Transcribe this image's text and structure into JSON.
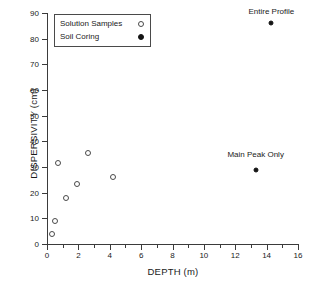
{
  "chart_data": {
    "type": "scatter",
    "title": "",
    "xlabel": "DEPTH (m)",
    "ylabel": "DISPERSIVITY (cm)",
    "xlim": [
      0,
      16
    ],
    "ylim": [
      0,
      90
    ],
    "xticks": [
      0,
      2,
      4,
      6,
      8,
      10,
      12,
      14,
      16
    ],
    "xticks_minor": [
      1,
      3,
      5,
      7,
      9,
      11,
      13,
      15
    ],
    "yticks": [
      0,
      10,
      20,
      30,
      40,
      50,
      60,
      70,
      80,
      90
    ],
    "grid": false,
    "legend_position": "upper-left-inside",
    "series": [
      {
        "name": "Solution Samples",
        "marker": "open-circle",
        "color": "#4a4a4a",
        "points": [
          {
            "x": 0.3,
            "y": 4
          },
          {
            "x": 0.5,
            "y": 9
          },
          {
            "x": 0.7,
            "y": 31.5
          },
          {
            "x": 1.2,
            "y": 18
          },
          {
            "x": 1.9,
            "y": 23.5
          },
          {
            "x": 2.6,
            "y": 35.5
          },
          {
            "x": 4.2,
            "y": 26
          }
        ]
      },
      {
        "name": "Soil Coring",
        "marker": "filled-circle",
        "color": "#141414",
        "points": [
          {
            "x": 13.3,
            "y": 29,
            "label": "Main Peak Only"
          },
          {
            "x": 14.3,
            "y": 86,
            "label": "Entire Profile"
          }
        ]
      }
    ],
    "annotations": [
      {
        "text": "Entire Profile",
        "x": 14.3,
        "y": 90.5
      },
      {
        "text": "Main Peak Only",
        "x": 13.3,
        "y": 34.5
      }
    ]
  },
  "legend": {
    "entries": [
      {
        "label": "Solution Samples",
        "marker": "open-circle"
      },
      {
        "label": "Soil Coring",
        "marker": "filled-circle"
      }
    ]
  }
}
